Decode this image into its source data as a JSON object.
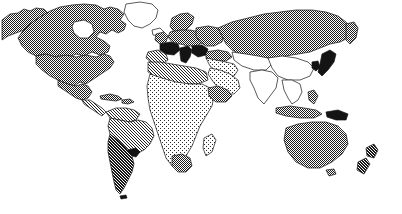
{
  "figure": {
    "type": "world-map",
    "title": "World map with dithered country shading",
    "width": 402,
    "height": 214,
    "background_color": "#ffffff",
    "outline_color": "#141414",
    "projection": "equirectangular-like",
    "style": "monochrome halftone / dithered bitmap"
  },
  "legend": {
    "visible": false,
    "shading_levels": [
      {
        "key": "none",
        "label": "No shading",
        "density_percent": 0,
        "color": "#ffffff"
      },
      {
        "key": "very-light",
        "label": "Very light stipple",
        "density_percent": 10,
        "color": "#ededed"
      },
      {
        "key": "light",
        "label": "Light dither",
        "density_percent": 25,
        "color": "#c9c9c9"
      },
      {
        "key": "medium",
        "label": "Medium cross-hatch",
        "density_percent": 50,
        "color": "#9a9a9a"
      },
      {
        "key": "dense",
        "label": "Dense cross-hatch",
        "density_percent": 65,
        "color": "#7a7a7a"
      },
      {
        "key": "solid",
        "label": "Solid black",
        "density_percent": 100,
        "color": "#141414"
      }
    ]
  },
  "regions": [
    {
      "name": "Alaska",
      "shading": "medium"
    },
    {
      "name": "Canada",
      "shading": "medium"
    },
    {
      "name": "Greenland",
      "shading": "none"
    },
    {
      "name": "United States",
      "shading": "medium"
    },
    {
      "name": "Mexico",
      "shading": "medium"
    },
    {
      "name": "Central America",
      "shading": "light"
    },
    {
      "name": "Caribbean",
      "shading": "medium"
    },
    {
      "name": "Colombia/Venezuela",
      "shading": "light"
    },
    {
      "name": "Brazil",
      "shading": "light"
    },
    {
      "name": "Uruguay",
      "shading": "solid"
    },
    {
      "name": "Argentina/Chile",
      "shading": "dense"
    },
    {
      "name": "Iceland",
      "shading": "none"
    },
    {
      "name": "United Kingdom",
      "shading": "medium"
    },
    {
      "name": "Scandinavia",
      "shading": "medium"
    },
    {
      "name": "France",
      "shading": "solid"
    },
    {
      "name": "Iberia",
      "shading": "light"
    },
    {
      "name": "Italy",
      "shading": "solid"
    },
    {
      "name": "Central Europe",
      "shading": "medium"
    },
    {
      "name": "Eastern Europe",
      "shading": "medium"
    },
    {
      "name": "Russia",
      "shading": "medium"
    },
    {
      "name": "Turkey",
      "shading": "medium"
    },
    {
      "name": "Middle East",
      "shading": "very-light"
    },
    {
      "name": "Arabian Peninsula",
      "shading": "very-light"
    },
    {
      "name": "North Africa",
      "shading": "light"
    },
    {
      "name": "Sub-Saharan Africa",
      "shading": "very-light"
    },
    {
      "name": "Horn of Africa",
      "shading": "medium"
    },
    {
      "name": "Madagascar",
      "shading": "very-light"
    },
    {
      "name": "South Africa",
      "shading": "medium"
    },
    {
      "name": "India",
      "shading": "none"
    },
    {
      "name": "China",
      "shading": "none"
    },
    {
      "name": "Southeast Asia",
      "shading": "none"
    },
    {
      "name": "Japan",
      "shading": "solid"
    },
    {
      "name": "Korea",
      "shading": "solid"
    },
    {
      "name": "Indonesia",
      "shading": "medium"
    },
    {
      "name": "Papua New Guinea",
      "shading": "solid"
    },
    {
      "name": "Australia",
      "shading": "medium"
    },
    {
      "name": "New Zealand",
      "shading": "dense"
    }
  ]
}
